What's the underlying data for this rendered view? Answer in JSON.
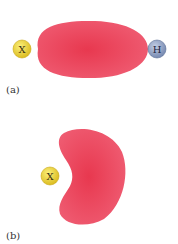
{
  "panels": [
    {
      "label": "(a)",
      "atoms": [
        {
          "symbol": "X",
          "color": "#e8d12e"
        },
        {
          "symbol": "H",
          "color": "#8ea1c6"
        }
      ],
      "orbital_color": "#e8435d"
    },
    {
      "label": "(b)",
      "atoms": [
        {
          "symbol": "X",
          "color": "#e8d12e"
        }
      ],
      "orbital_color": "#e8435d"
    }
  ]
}
